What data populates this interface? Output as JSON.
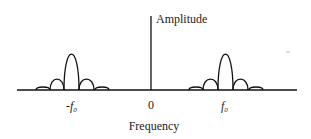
{
  "diagram": {
    "type": "spectrum",
    "y_axis_label": "Amplitude",
    "x_axis_label": "Frequency",
    "ticks": [
      {
        "label": "-f",
        "sub": "0",
        "x": 72
      },
      {
        "label": "0",
        "sub": "",
        "x": 151
      },
      {
        "label": "f",
        "sub": "0",
        "x": 226
      }
    ],
    "colors": {
      "line": "#111111",
      "text": "#222222",
      "background": "#ffffff"
    },
    "lobes": {
      "left": [
        {
          "x0": 36,
          "x1": 50,
          "height": 3
        },
        {
          "x0": 50,
          "x1": 64,
          "height": 11
        },
        {
          "x0": 64,
          "x1": 79,
          "height": 36
        },
        {
          "x0": 79,
          "x1": 94,
          "height": 11
        },
        {
          "x0": 95,
          "x1": 109,
          "height": 3
        }
      ],
      "right": [
        {
          "x0": 189,
          "x1": 203,
          "height": 3
        },
        {
          "x0": 203,
          "x1": 218,
          "height": 11
        },
        {
          "x0": 218,
          "x1": 233,
          "height": 36
        },
        {
          "x0": 233,
          "x1": 248,
          "height": 11
        },
        {
          "x0": 249,
          "x1": 263,
          "height": 3
        }
      ]
    }
  }
}
